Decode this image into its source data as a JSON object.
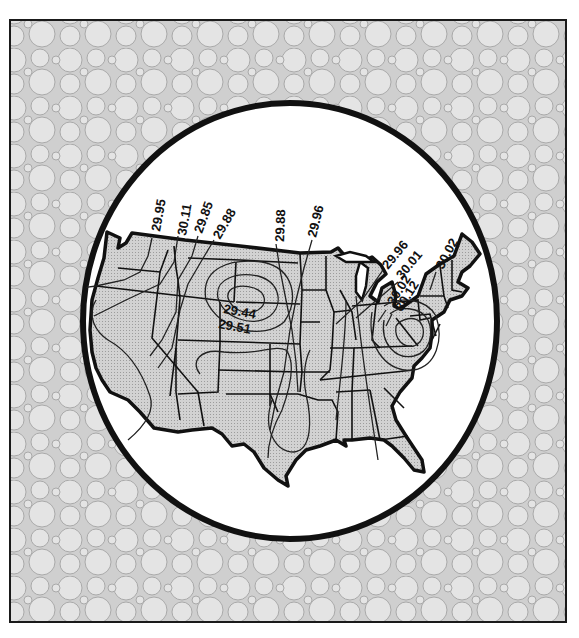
{
  "figure": {
    "colors": {
      "background": "#ffffff",
      "frame_pattern_fill": "#e2e2e2",
      "frame_pattern_stroke": "#a8a8a8",
      "land_fill": "#cfcfcf",
      "outline": "#111111",
      "circle_fill": "#ffffff"
    }
  },
  "isobar_labels": [
    {
      "id": "wa",
      "text": "29.95",
      "x": 158,
      "y": 226,
      "rotate": -80
    },
    {
      "id": "id",
      "text": "30.11",
      "x": 184,
      "y": 232,
      "rotate": -80
    },
    {
      "id": "mt-w",
      "text": "29.85",
      "x": 203,
      "y": 230,
      "rotate": -70
    },
    {
      "id": "mt-e",
      "text": "29.88",
      "x": 220,
      "y": 238,
      "rotate": -60
    },
    {
      "id": "nd",
      "text": "29.88",
      "x": 283,
      "y": 238,
      "rotate": -90
    },
    {
      "id": "mn",
      "text": "29.96",
      "x": 316,
      "y": 234,
      "rotate": -75
    },
    {
      "id": "low-inner",
      "text": "29.44",
      "x": 224,
      "y": 308,
      "rotate": 10
    },
    {
      "id": "low-outer",
      "text": "29.51",
      "x": 219,
      "y": 324,
      "rotate": 10
    },
    {
      "id": "mi",
      "text": "29.96",
      "x": 390,
      "y": 264,
      "rotate": -50
    },
    {
      "id": "oh-1",
      "text": "30.01",
      "x": 404,
      "y": 275,
      "rotate": -50
    },
    {
      "id": "oh-2",
      "text": "30.02",
      "x": 393,
      "y": 302,
      "rotate": -60
    },
    {
      "id": "oh-3",
      "text": "30.12",
      "x": 398,
      "y": 307,
      "rotate": -60
    },
    {
      "id": "ny",
      "text": "30.02",
      "x": 440,
      "y": 264,
      "rotate": -60
    }
  ]
}
